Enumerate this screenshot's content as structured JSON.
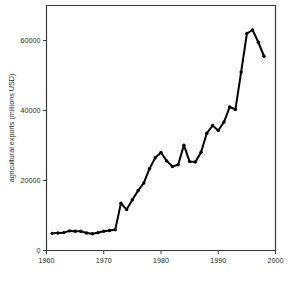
{
  "chart_data": {
    "type": "line",
    "title": "",
    "xlabel": "",
    "ylabel": "agricultural exports (millions USD)",
    "xlim": [
      1960,
      2000
    ],
    "ylim": [
      0,
      70000
    ],
    "grid": false,
    "legend": "none",
    "xticks": [
      1960,
      1970,
      1980,
      1990,
      2000
    ],
    "xtick_labels": [
      "1960",
      "1970",
      "1980",
      "1990",
      "2000"
    ],
    "yticks": [
      0,
      20000,
      40000,
      60000
    ],
    "ytick_labels": [
      "0",
      "20000",
      "40000",
      "60000"
    ],
    "marker": "filled-circle",
    "line_color": "#000000",
    "x": [
      1961,
      1962,
      1963,
      1964,
      1965,
      1966,
      1967,
      1968,
      1969,
      1970,
      1971,
      1972,
      1973,
      1974,
      1975,
      1976,
      1977,
      1978,
      1979,
      1980,
      1981,
      1982,
      1983,
      1984,
      1985,
      1986,
      1987,
      1988,
      1989,
      1990,
      1991,
      1992,
      1993,
      1994,
      1995,
      1996,
      1997,
      1998
    ],
    "values": [
      4900,
      5000,
      5100,
      5600,
      5500,
      5500,
      5000,
      4800,
      5100,
      5500,
      5700,
      5900,
      13500,
      11700,
      14500,
      17100,
      19300,
      23400,
      26500,
      28000,
      25600,
      24000,
      24500,
      30100,
      25400,
      25300,
      28100,
      33500,
      35700,
      34300,
      36700,
      41000,
      40300,
      51000,
      62000,
      63000,
      59500,
      55500
    ],
    "annotations": []
  }
}
